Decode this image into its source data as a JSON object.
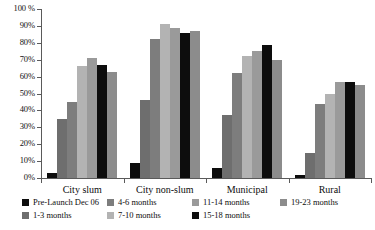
{
  "chart_data": {
    "type": "bar",
    "title": "",
    "xlabel": "",
    "ylabel": "",
    "ylim": [
      0,
      100
    ],
    "y_unit": "%",
    "grid": false,
    "legend_position": "bottom",
    "categories": [
      "City slum",
      "City non-slum",
      "Municipal",
      "Rural"
    ],
    "y_ticks": [
      "0%",
      "10%",
      "20%",
      "30%",
      "40%",
      "50%",
      "60%",
      "70%",
      "80%",
      "90%",
      "100 %"
    ],
    "y_tick_values": [
      0,
      10,
      20,
      30,
      40,
      50,
      60,
      70,
      80,
      90,
      100
    ],
    "series": [
      {
        "name": "Pre-Launch Dec 06",
        "color": "#0d0d0d",
        "values": [
          3,
          9,
          6,
          2
        ]
      },
      {
        "name": "1-3 months",
        "color": "#6e6e6e",
        "values": [
          35,
          46,
          37,
          15
        ]
      },
      {
        "name": "4-6 months",
        "color": "#7d7d7d",
        "values": [
          45,
          82,
          62,
          44
        ]
      },
      {
        "name": "7-10 months",
        "color": "#b3b3b3",
        "values": [
          66,
          91,
          72,
          50
        ]
      },
      {
        "name": "11-14 months",
        "color": "#9a9a9a",
        "values": [
          71,
          89,
          75,
          57
        ]
      },
      {
        "name": "15-18 months",
        "color": "#0d0d0d",
        "values": [
          67,
          86,
          79,
          57
        ]
      },
      {
        "name": "19-23 months",
        "color": "#8c8c8c",
        "values": [
          63,
          87,
          70,
          55
        ]
      }
    ]
  },
  "legend": {
    "items": [
      {
        "label": "Pre-Launch Dec 06",
        "color": "#0d0d0d"
      },
      {
        "label": "1-3 months",
        "color": "#6e6e6e"
      },
      {
        "label": "4-6 months",
        "color": "#7d7d7d"
      },
      {
        "label": "7-10 months",
        "color": "#b3b3b3"
      },
      {
        "label": "11-14 months",
        "color": "#9a9a9a"
      },
      {
        "label": "15-18 months",
        "color": "#0d0d0d"
      },
      {
        "label": "19-23 months",
        "color": "#8c8c8c"
      }
    ]
  }
}
